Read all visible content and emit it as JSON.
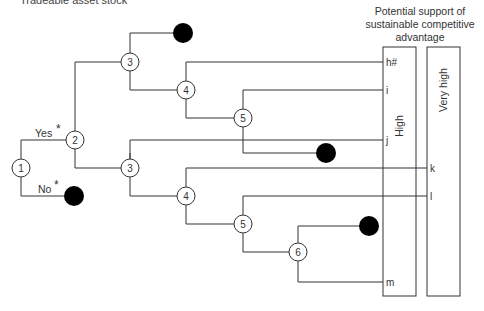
{
  "title": "Tradeable asset stock",
  "header": {
    "line1": "Potential support of",
    "line2": "sustainable competitive",
    "line3": "advantage"
  },
  "columns": {
    "high": "High",
    "very_high": "Very high"
  },
  "branch_labels": {
    "yes": "Yes",
    "no": "No",
    "star": "*"
  },
  "nodes": [
    {
      "id": "n1",
      "label": "1"
    },
    {
      "id": "n2",
      "label": "2"
    },
    {
      "id": "n3a",
      "label": "3"
    },
    {
      "id": "n4a",
      "label": "4"
    },
    {
      "id": "n5a",
      "label": "5"
    },
    {
      "id": "n3b",
      "label": "3"
    },
    {
      "id": "n4b",
      "label": "4"
    },
    {
      "id": "n5b",
      "label": "5"
    },
    {
      "id": "n6",
      "label": "6"
    }
  ],
  "outcomes": {
    "h": "h#",
    "i": "i",
    "j": "j",
    "k": "k",
    "l": "l",
    "m": "m"
  },
  "colors": {
    "line": "#333333",
    "terminal": "#000000"
  }
}
